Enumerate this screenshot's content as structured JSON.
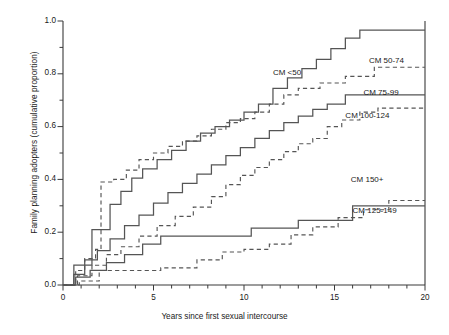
{
  "chart_data": {
    "type": "line",
    "title": "",
    "xlabel": "Years since first sexual intercourse",
    "ylabel": "Family planning adopters (cumulative proportion)",
    "xlim": [
      0,
      20
    ],
    "ylim": [
      0.0,
      1.0
    ],
    "xticks": [
      0,
      5,
      10,
      15,
      20
    ],
    "xticklabels": [
      "0",
      "5",
      "10",
      "15",
      "20"
    ],
    "yticks": [
      0.0,
      0.2,
      0.4,
      0.6,
      0.8,
      1.0
    ],
    "yticklabels": [
      "0.0",
      "0.2",
      "0.4",
      "0.6",
      "0.8",
      "1.0"
    ],
    "xminor_step": 1,
    "yminor_step": 0.1,
    "grid": false,
    "legend_position": "inline-annotations",
    "step_style": "post",
    "series": [
      {
        "name": "CM <50",
        "linestyle": "solid",
        "color": "#555555",
        "label_x": 11.6,
        "label_y": 0.8,
        "x": [
          0,
          0.6,
          1.0,
          1.6,
          2.0,
          2.6,
          3.2,
          3.8,
          4.4,
          5.2,
          6.0,
          6.8,
          7.6,
          8.4,
          9.2,
          10.0,
          10.8,
          11.6,
          12.4,
          13.2,
          14.0,
          14.8,
          15.6,
          16.4,
          20
        ],
        "y": [
          0.0,
          0.075,
          0.075,
          0.21,
          0.21,
          0.305,
          0.355,
          0.405,
          0.44,
          0.475,
          0.51,
          0.545,
          0.575,
          0.6,
          0.625,
          0.655,
          0.685,
          0.745,
          0.785,
          0.82,
          0.855,
          0.895,
          0.935,
          0.965,
          0.965
        ]
      },
      {
        "name": "CM 50-74",
        "linestyle": "dashed",
        "color": "#555555",
        "label_x": 16.9,
        "label_y": 0.845,
        "x": [
          0,
          0.7,
          1.2,
          1.8,
          2.1,
          2.8,
          3.5,
          4.2,
          5.0,
          5.8,
          6.6,
          7.4,
          8.2,
          9.0,
          9.8,
          10.6,
          11.4,
          12.2,
          13.0,
          14.2,
          15.6,
          17.2,
          20
        ],
        "y": [
          0.0,
          0.055,
          0.1,
          0.135,
          0.39,
          0.4,
          0.435,
          0.475,
          0.5,
          0.525,
          0.545,
          0.565,
          0.59,
          0.615,
          0.63,
          0.655,
          0.685,
          0.72,
          0.745,
          0.765,
          0.79,
          0.825,
          0.825
        ]
      },
      {
        "name": "CM 75-99",
        "linestyle": "solid",
        "color": "#555555",
        "label_x": 16.6,
        "label_y": 0.725,
        "x": [
          0,
          0.6,
          1.2,
          1.9,
          2.6,
          3.4,
          4.2,
          5.0,
          5.8,
          6.6,
          7.4,
          8.2,
          9.0,
          9.8,
          10.6,
          11.4,
          12.2,
          13.0,
          13.8,
          14.6,
          15.6,
          20
        ],
        "y": [
          0.0,
          0.04,
          0.095,
          0.13,
          0.175,
          0.225,
          0.265,
          0.31,
          0.35,
          0.385,
          0.42,
          0.455,
          0.49,
          0.52,
          0.555,
          0.585,
          0.615,
          0.64,
          0.665,
          0.685,
          0.72,
          0.72
        ]
      },
      {
        "name": "CM 100-124",
        "linestyle": "dashed",
        "color": "#555555",
        "label_x": 15.6,
        "label_y": 0.635,
        "x": [
          0,
          0.8,
          1.6,
          2.4,
          3.2,
          4.2,
          5.2,
          6.2,
          7.2,
          8.2,
          9.0,
          9.8,
          10.6,
          11.4,
          12.2,
          13.0,
          13.8,
          14.6,
          15.4,
          16.4,
          17.4,
          20
        ],
        "y": [
          0.0,
          0.035,
          0.075,
          0.115,
          0.145,
          0.185,
          0.225,
          0.26,
          0.295,
          0.335,
          0.38,
          0.415,
          0.445,
          0.475,
          0.505,
          0.535,
          0.555,
          0.6,
          0.625,
          0.655,
          0.67,
          0.67
        ]
      },
      {
        "name": "CM 125-149",
        "linestyle": "solid",
        "color": "#555555",
        "label_x": 16.0,
        "label_y": 0.275,
        "x": [
          0,
          0.7,
          1.5,
          2.4,
          3.4,
          4.4,
          5.4,
          8.6,
          10.4,
          13.0,
          16.0,
          20
        ],
        "y": [
          0.0,
          0.03,
          0.055,
          0.085,
          0.115,
          0.155,
          0.185,
          0.185,
          0.215,
          0.245,
          0.3,
          0.3
        ]
      },
      {
        "name": "CM 150+",
        "linestyle": "dashed",
        "color": "#555555",
        "label_x": 15.9,
        "label_y": 0.395,
        "x": [
          0,
          0.9,
          2.0,
          3.6,
          5.4,
          7.4,
          8.8,
          10.0,
          11.4,
          12.6,
          13.8,
          15.2,
          16.6,
          18.0,
          20
        ],
        "y": [
          0.0,
          0.015,
          0.055,
          0.055,
          0.065,
          0.095,
          0.125,
          0.135,
          0.155,
          0.19,
          0.22,
          0.255,
          0.285,
          0.32,
          0.32
        ]
      }
    ]
  },
  "axes": {
    "xlabel": "Years since first sexual intercourse",
    "ylabel": "Family planning adopters (cumulative proportion)"
  }
}
